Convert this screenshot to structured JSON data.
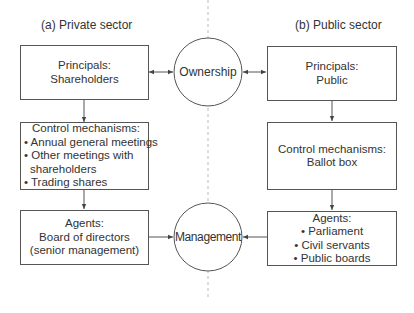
{
  "panels": {
    "private": {
      "title": "(a) Private sector",
      "principals": {
        "heading": "Principals:",
        "lines": [
          "Shareholders"
        ]
      },
      "control": {
        "heading": "Control mechanisms:",
        "bullets": [
          "Annual general meetings",
          "Other meetings with",
          "shareholders",
          "Trading shares"
        ]
      },
      "agents": {
        "heading": "Agents:",
        "lines": [
          "Board of directors",
          "(senior management)"
        ]
      }
    },
    "public": {
      "title": "(b) Public sector",
      "principals": {
        "heading": "Principals:",
        "lines": [
          "Public"
        ]
      },
      "control": {
        "heading": "Control mechanisms:",
        "lines": [
          "Ballot box"
        ]
      },
      "agents": {
        "heading": "Agents:",
        "bullets": [
          "Parliament",
          "Civil servants",
          "Public boards"
        ]
      }
    }
  },
  "center": {
    "ownership": "Ownership",
    "management": "Management"
  },
  "colors": {
    "line": "#555555",
    "divider": "#bbbbbb",
    "text": "#333333"
  }
}
